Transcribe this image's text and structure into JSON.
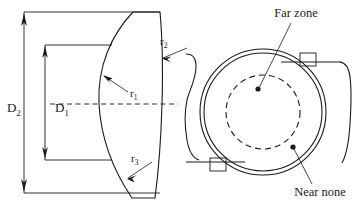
{
  "figure": {
    "background_color": "#ffffff",
    "line_color": "#1a1a1a",
    "width": 362,
    "height": 211
  },
  "cross_section": {
    "name": "lens-cross-section",
    "dimensions": [
      {
        "id": "D2",
        "base": "D",
        "subscript": "2",
        "description": "overall lens diameter",
        "x": 14,
        "y": 107
      },
      {
        "id": "D1",
        "base": "D",
        "subscript": "1",
        "description": "optic zone diameter",
        "x": 40,
        "y": 107
      }
    ],
    "radii": [
      {
        "id": "r1",
        "base": "r",
        "subscript": "1",
        "description": "front concave base curve radius",
        "x": 118,
        "y": 93
      },
      {
        "id": "r2",
        "base": "r",
        "subscript": "2",
        "description": "upper peripheral radius",
        "x": 161,
        "y": 42
      },
      {
        "id": "r3",
        "base": "r",
        "subscript": "3",
        "description": "lower peripheral radius",
        "x": 133,
        "y": 162
      }
    ]
  },
  "plan_view": {
    "name": "lens-plan-view",
    "annotations": [
      {
        "id": "far-zone",
        "label": "Far zone",
        "label_x": 296,
        "label_y": 17,
        "marker_x": 258,
        "marker_y": 89
      },
      {
        "id": "near-none",
        "label": "Near none",
        "label_x": 320,
        "label_y": 196,
        "marker_x": 293,
        "marker_y": 147
      }
    ],
    "geometry": {
      "center_x": 263,
      "center_y": 112,
      "outer_radius": 63,
      "inner_ring_radius": 59,
      "dashed_zone_radius": 37
    }
  }
}
